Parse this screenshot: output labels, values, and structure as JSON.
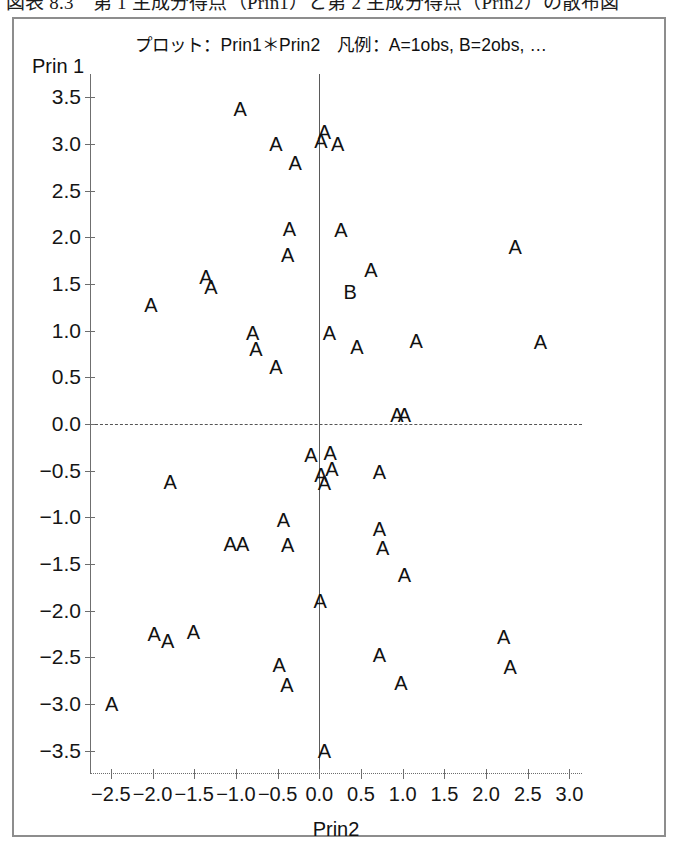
{
  "caption": {
    "text": "図表 8.3　第 1 主成分得点（Prin1）と第 2 主成分得点（Prin2）の散布図"
  },
  "chart_data": {
    "type": "scatter",
    "title": "プロット：Prin1＊Prin2　凡例：A=1obs, B=2obs, …",
    "xlabel": "Prin2",
    "ylabel": "Prin 1",
    "xlim": [
      -2.75,
      3.15
    ],
    "ylim": [
      -3.75,
      3.75
    ],
    "xticks": [
      -2.5,
      -2.0,
      -1.5,
      -1.0,
      -0.5,
      0.0,
      0.5,
      1.0,
      1.5,
      2.0,
      2.5,
      3.0
    ],
    "xtick_labels": [
      "−2.5",
      "−2.0",
      "−1.5",
      "−1.0",
      "−0.5",
      "0.0",
      "0.5",
      "1.0",
      "1.5",
      "2.0",
      "2.5",
      "3.0"
    ],
    "yticks": [
      3.5,
      3.0,
      2.5,
      2.0,
      1.5,
      1.0,
      0.5,
      0.0,
      -0.5,
      -1.0,
      -1.5,
      -2.0,
      -2.5,
      -3.0,
      -3.5
    ],
    "ytick_labels": [
      "3.5",
      "3.0",
      "2.5",
      "2.0",
      "1.5",
      "1.0",
      "0.5",
      "0.0",
      "−0.5",
      "−1.0",
      "−1.5",
      "−2.0",
      "−2.5",
      "−3.0",
      "−3.5"
    ],
    "grid": false,
    "reference_lines": {
      "x": 0.0,
      "y": 0.0
    },
    "legend": {
      "A": "1obs",
      "B": "2obs"
    },
    "points": [
      {
        "x": -0.95,
        "y": 3.37,
        "label": "A"
      },
      {
        "x": -0.52,
        "y": 3.0,
        "label": "A"
      },
      {
        "x": -0.29,
        "y": 2.8,
        "label": "A"
      },
      {
        "x": 0.06,
        "y": 3.13,
        "label": "A"
      },
      {
        "x": 0.02,
        "y": 3.03,
        "label": "A"
      },
      {
        "x": 0.22,
        "y": 3.0,
        "label": "A"
      },
      {
        "x": -0.36,
        "y": 2.09,
        "label": "A"
      },
      {
        "x": -0.38,
        "y": 1.81,
        "label": "A"
      },
      {
        "x": 0.26,
        "y": 2.08,
        "label": "A"
      },
      {
        "x": 2.35,
        "y": 1.9,
        "label": "A"
      },
      {
        "x": 0.62,
        "y": 1.65,
        "label": "A"
      },
      {
        "x": -1.36,
        "y": 1.58,
        "label": "A"
      },
      {
        "x": -1.3,
        "y": 1.47,
        "label": "A"
      },
      {
        "x": 0.37,
        "y": 1.41,
        "label": "B"
      },
      {
        "x": -2.02,
        "y": 1.27,
        "label": "A"
      },
      {
        "x": -0.8,
        "y": 0.97,
        "label": "A"
      },
      {
        "x": -0.76,
        "y": 0.8,
        "label": "A"
      },
      {
        "x": -0.52,
        "y": 0.61,
        "label": "A"
      },
      {
        "x": 0.12,
        "y": 0.98,
        "label": "A"
      },
      {
        "x": 0.45,
        "y": 0.82,
        "label": "A"
      },
      {
        "x": 1.16,
        "y": 0.89,
        "label": "A"
      },
      {
        "x": 2.65,
        "y": 0.88,
        "label": "A"
      },
      {
        "x": 0.93,
        "y": 0.1,
        "label": "A"
      },
      {
        "x": 1.02,
        "y": 0.1,
        "label": "A"
      },
      {
        "x": -0.1,
        "y": -0.33,
        "label": "A"
      },
      {
        "x": 0.13,
        "y": -0.31,
        "label": "A"
      },
      {
        "x": 0.02,
        "y": -0.55,
        "label": "A"
      },
      {
        "x": 0.15,
        "y": -0.48,
        "label": "A"
      },
      {
        "x": 0.06,
        "y": -0.63,
        "label": "A"
      },
      {
        "x": 0.72,
        "y": -0.51,
        "label": "A"
      },
      {
        "x": -1.79,
        "y": -0.62,
        "label": "A"
      },
      {
        "x": -0.43,
        "y": -1.03,
        "label": "A"
      },
      {
        "x": 0.72,
        "y": -1.12,
        "label": "A"
      },
      {
        "x": -1.07,
        "y": -1.29,
        "label": "A"
      },
      {
        "x": -0.92,
        "y": -1.29,
        "label": "A"
      },
      {
        "x": -0.38,
        "y": -1.3,
        "label": "A"
      },
      {
        "x": 0.76,
        "y": -1.33,
        "label": "A"
      },
      {
        "x": 1.02,
        "y": -1.62,
        "label": "A"
      },
      {
        "x": 0.01,
        "y": -1.9,
        "label": "A"
      },
      {
        "x": -1.98,
        "y": -2.25,
        "label": "A"
      },
      {
        "x": -1.82,
        "y": -2.32,
        "label": "A"
      },
      {
        "x": -1.51,
        "y": -2.23,
        "label": "A"
      },
      {
        "x": 2.21,
        "y": -2.28,
        "label": "A"
      },
      {
        "x": -0.48,
        "y": -2.58,
        "label": "A"
      },
      {
        "x": 0.72,
        "y": -2.48,
        "label": "A"
      },
      {
        "x": 2.29,
        "y": -2.6,
        "label": "A"
      },
      {
        "x": -0.39,
        "y": -2.8,
        "label": "A"
      },
      {
        "x": 0.98,
        "y": -2.78,
        "label": "A"
      },
      {
        "x": -2.49,
        "y": -3.0,
        "label": "A"
      },
      {
        "x": 0.06,
        "y": -3.5,
        "label": "A"
      }
    ]
  }
}
